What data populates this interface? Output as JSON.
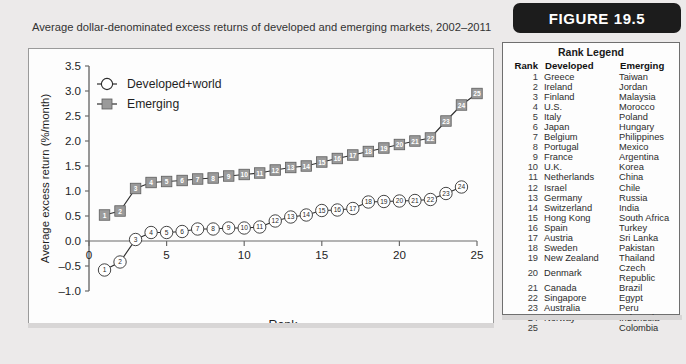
{
  "figure": {
    "badge_label": "FIGURE 19.5"
  },
  "caption": "Average dollar-denominated excess returns of developed and emerging markets, 2002–2011",
  "rank_legend": {
    "title": "Rank Legend",
    "headers": [
      "Rank",
      "Developed",
      "Emerging"
    ],
    "rows": [
      [
        "1",
        "Greece",
        "Taiwan"
      ],
      [
        "2",
        "Ireland",
        "Jordan"
      ],
      [
        "3",
        "Finland",
        "Malaysia"
      ],
      [
        "4",
        "U.S.",
        "Morocco"
      ],
      [
        "5",
        "Italy",
        "Poland"
      ],
      [
        "6",
        "Japan",
        "Hungary"
      ],
      [
        "7",
        "Belgium",
        "Philippines"
      ],
      [
        "8",
        "Portugal",
        "Mexico"
      ],
      [
        "9",
        "France",
        "Argentina"
      ],
      [
        "10",
        "U.K.",
        "Korea"
      ],
      [
        "11",
        "Netherlands",
        "China"
      ],
      [
        "12",
        "Israel",
        "Chile"
      ],
      [
        "13",
        "Germany",
        "Russia"
      ],
      [
        "14",
        "Switzerland",
        "India"
      ],
      [
        "15",
        "Hong Kong",
        "South Africa"
      ],
      [
        "16",
        "Spain",
        "Turkey"
      ],
      [
        "17",
        "Austria",
        "Sri Lanka"
      ],
      [
        "18",
        "Sweden",
        "Pakistan"
      ],
      [
        "19",
        "New Zealand",
        "Thailand"
      ],
      [
        "20",
        "Denmark",
        "Czech Republic"
      ],
      [
        "21",
        "Canada",
        "Brazil"
      ],
      [
        "22",
        "Singapore",
        "Egypt"
      ],
      [
        "23",
        "Australia",
        "Peru"
      ],
      [
        "24",
        "Norway",
        "Indonesia"
      ],
      [
        "25",
        "",
        "Colombia"
      ]
    ]
  },
  "chart_data": {
    "type": "line",
    "title": "",
    "xlabel": "Rank",
    "xlabel_sub": "Markets are sorted by average returns, from low to high",
    "ylabel": "Average excess return (%/month)",
    "xlim": [
      0,
      25
    ],
    "ylim": [
      -1.0,
      3.5
    ],
    "xticks": [
      0,
      5,
      10,
      15,
      20,
      25
    ],
    "xtick_labels": [
      "0",
      "5",
      "10",
      "15",
      "20",
      "25"
    ],
    "yticks": [
      -1.0,
      -0.5,
      0.0,
      0.5,
      1.0,
      1.5,
      2.0,
      2.5,
      3.0,
      3.5
    ],
    "ytick_labels": [
      "-1.0",
      "-0.5",
      "0.0",
      "0.5",
      "1.0",
      "1.5",
      "2.0",
      "2.5",
      "3.0",
      "3.5"
    ],
    "grid": false,
    "legend_position": "top-left",
    "series": [
      {
        "name": "Developed+world",
        "marker": "open-circle",
        "color": "#2b2b2b",
        "x": [
          1,
          2,
          3,
          4,
          5,
          6,
          7,
          8,
          9,
          10,
          11,
          12,
          13,
          14,
          15,
          16,
          17,
          18,
          19,
          20,
          21,
          22,
          23,
          24
        ],
        "values": [
          -0.58,
          -0.42,
          0.03,
          0.17,
          0.17,
          0.19,
          0.24,
          0.24,
          0.26,
          0.26,
          0.28,
          0.4,
          0.48,
          0.52,
          0.61,
          0.62,
          0.65,
          0.78,
          0.79,
          0.8,
          0.81,
          0.83,
          0.95,
          1.08
        ]
      },
      {
        "name": "Emerging",
        "marker": "filled-square",
        "color": "#8c8c8c",
        "x": [
          1,
          2,
          3,
          4,
          5,
          6,
          7,
          8,
          9,
          10,
          11,
          12,
          13,
          14,
          15,
          16,
          17,
          18,
          19,
          20,
          21,
          22,
          23,
          24,
          25
        ],
        "values": [
          0.52,
          0.6,
          1.05,
          1.17,
          1.19,
          1.21,
          1.24,
          1.26,
          1.3,
          1.33,
          1.36,
          1.42,
          1.47,
          1.5,
          1.58,
          1.65,
          1.72,
          1.79,
          1.86,
          1.93,
          2.0,
          2.06,
          2.4,
          2.72,
          2.95
        ]
      }
    ]
  }
}
